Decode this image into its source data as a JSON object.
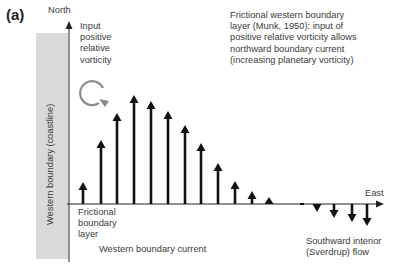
{
  "panel_label": "(a)",
  "axes": {
    "y_label": "North",
    "x_label": "East"
  },
  "coastline": {
    "label": "Western boundary (coastline)",
    "color": "#d9d9d9"
  },
  "annotations": {
    "vorticity_input": [
      "Input",
      "positive",
      "relative",
      "vorticity"
    ],
    "munk_note": [
      "Frictional western boundary",
      "layer (Munk, 1950): input of",
      "positive relative vorticity allows",
      "northward boundary current",
      "(increasing planetary vorticity)"
    ],
    "frictional_layer": [
      "Frictional",
      "boundary",
      "layer"
    ],
    "western_boundary_current": "Western boundary current",
    "interior_flow": [
      "Southward interior",
      "(Sverdrup) flow"
    ]
  },
  "colors": {
    "arrow": "#111111",
    "axis": "#222222",
    "vorticity_circle": "#8a8a8a",
    "text": "#3a3a3a"
  },
  "chart_data": {
    "type": "bar",
    "xlabel": "East",
    "ylabel": "North",
    "x": [
      1,
      2,
      3,
      4,
      5,
      6,
      7,
      8,
      9,
      10,
      11,
      12,
      13,
      14,
      15,
      16,
      17
    ],
    "values": [
      22,
      64,
      91,
      109,
      103,
      93,
      79,
      61,
      41,
      23,
      13,
      7,
      0,
      -8,
      -14,
      -18,
      -22
    ],
    "grid": false
  }
}
